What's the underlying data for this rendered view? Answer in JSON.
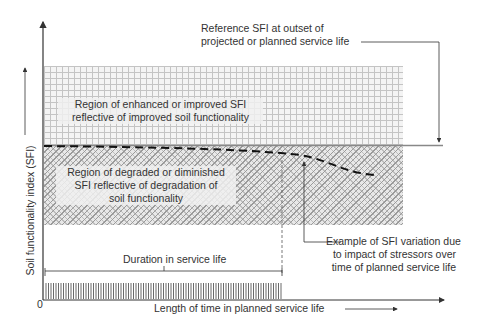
{
  "diagram": {
    "y_axis_label": "Soil functionality index (SFI)",
    "x_axis_label": "Length of time in planned service life",
    "origin_label": "0",
    "regions": {
      "upper": "Region of enhanced or improved SFI reflective of improved soil functionality",
      "upper_lines": [
        "Region of enhanced or improved SFI",
        "reflective of improved soil functionality"
      ],
      "lower_lines": [
        "Region of degraded or diminished",
        "SFI reflective of degradation of",
        "soil functionality"
      ]
    },
    "annotations": {
      "reference_lines": [
        "Reference SFI at outset of",
        "projected or planned service life"
      ],
      "example_lines": [
        "Example of SFI variation due",
        "to impact of stressors over",
        "time of planned service life"
      ],
      "duration": "Duration in service life"
    },
    "colors": {
      "axis": "#333333",
      "reference_line": "#888888",
      "grid_pattern": "#c4c4c4",
      "hatch_pattern": "#9a9a9a",
      "curve": "#111111"
    }
  }
}
